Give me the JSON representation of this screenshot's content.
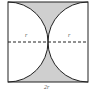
{
  "diagram": {
    "type": "geometry",
    "labels": {
      "radius_left": "r",
      "radius_right": "r",
      "side": "2r"
    },
    "colors": {
      "shade": "#cfcfcf",
      "stroke": "#222222"
    }
  }
}
